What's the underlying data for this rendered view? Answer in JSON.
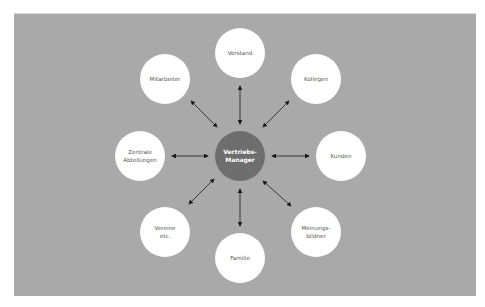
{
  "diagram": {
    "type": "hub-and-spoke",
    "center": {
      "label": "Vertriebs-\nManager",
      "x": 240,
      "y": 156,
      "color": "#6e6e6e"
    },
    "nodes": [
      {
        "id": "vorstand",
        "label": "Vorstand",
        "x": 240,
        "y": 53
      },
      {
        "id": "kollegen",
        "label": "Kollegen",
        "x": 316,
        "y": 79
      },
      {
        "id": "kunden",
        "label": "Kunden",
        "x": 341,
        "y": 156
      },
      {
        "id": "meinungsbildner",
        "label": "Meinungs-\nbildner",
        "x": 316,
        "y": 232
      },
      {
        "id": "familie",
        "label": "Familie",
        "x": 240,
        "y": 258
      },
      {
        "id": "vereine",
        "label": "Vereine\netc.",
        "x": 165,
        "y": 232
      },
      {
        "id": "zentrale-abteilungen",
        "label": "Zentrale\nAbteilungen",
        "x": 140,
        "y": 156
      },
      {
        "id": "mitarbeiter",
        "label": "Mitarbeiter",
        "x": 165,
        "y": 79
      }
    ],
    "edge_style": "double-headed-arrow",
    "colors": {
      "panel": "#a9a9a9",
      "node": "#ffffff",
      "arrow": "#1a1a1a",
      "text": "#555555"
    }
  }
}
